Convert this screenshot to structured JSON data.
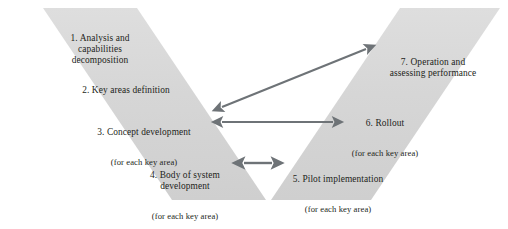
{
  "diagram": {
    "colors": {
      "arm_fill": "#d4d4d4",
      "arm_fill_light": "#dcdcdc",
      "arrow": "#6e7377",
      "text": "#231f20",
      "background": "#ffffff"
    },
    "left_arm_name": "descending-branch",
    "right_arm_name": "ascending-branch",
    "steps": [
      {
        "number": "1.",
        "title": "1. Analysis and\ncapabilities\ndecomposition",
        "sub": "",
        "side": "left"
      },
      {
        "number": "2.",
        "title": "2. Key areas definition",
        "sub": "",
        "side": "left"
      },
      {
        "number": "3.",
        "title": "3. Concept development",
        "sub": "(for each key area)",
        "side": "left"
      },
      {
        "number": "4.",
        "title": "4. Body of system\ndevelopment",
        "sub": "(for each key area)",
        "side": "left"
      },
      {
        "number": "5.",
        "title": "5. Pilot implementation",
        "sub": "(for each key area)",
        "side": "right"
      },
      {
        "number": "6.",
        "title": "6. Rollout",
        "sub": "(for each key area)",
        "side": "right"
      },
      {
        "number": "7.",
        "title": "7. Operation and\nassessing performance",
        "sub": "",
        "side": "right"
      }
    ],
    "connectors": [
      {
        "name": "concept-to-operation-arrow",
        "from_step": "3",
        "to_step": "7",
        "style": "double-headed diagonal"
      },
      {
        "name": "concept-to-rollout-arrow",
        "from_step": "3",
        "to_step": "6",
        "style": "double-headed horizontal"
      },
      {
        "name": "body-to-pilot-arrow",
        "from_step": "4",
        "to_step": "5",
        "style": "double-headed horizontal short"
      }
    ]
  }
}
